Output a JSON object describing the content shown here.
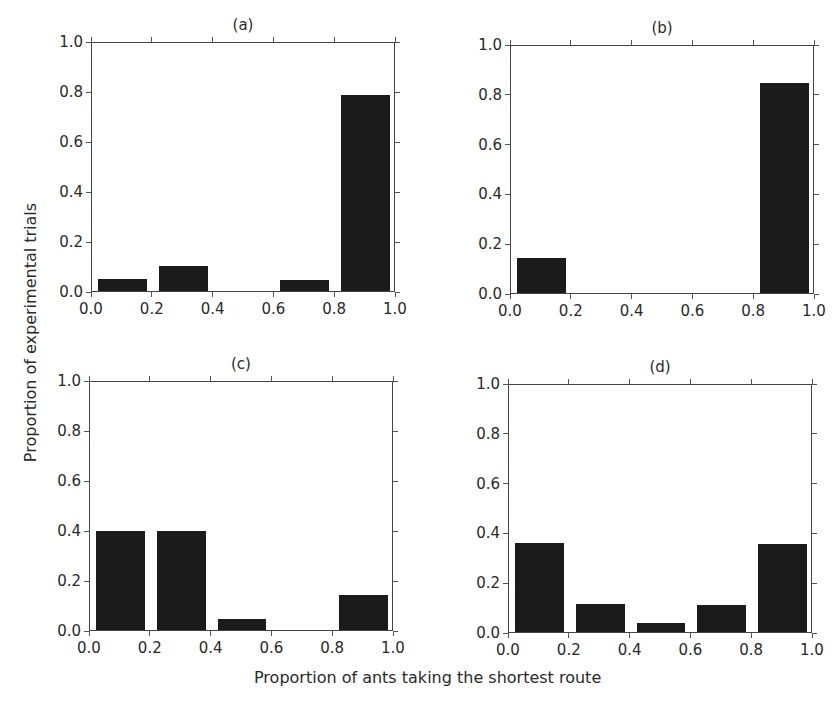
{
  "figure": {
    "ylabel": "Proportion of experimental trials",
    "xlabel": "Proportion of ants taking the shortest route"
  },
  "panels": [
    {
      "title": "(a)",
      "left": 91,
      "top": 42,
      "width": 304,
      "height": 250
    },
    {
      "title": "(b)",
      "left": 510,
      "top": 45,
      "width": 304,
      "height": 249
    },
    {
      "title": "(c)",
      "left": 89,
      "top": 381,
      "width": 304,
      "height": 250
    },
    {
      "title": "(d)",
      "left": 508,
      "top": 384,
      "width": 304,
      "height": 249
    }
  ],
  "ticks": {
    "x": [
      "0.0",
      "0.2",
      "0.4",
      "0.6",
      "0.8",
      "1.0"
    ],
    "y": [
      "0.0",
      "0.2",
      "0.4",
      "0.6",
      "0.8",
      "1.0"
    ]
  },
  "chart_data": [
    {
      "type": "bar",
      "title": "(a)",
      "categories": [
        "0.0-0.2",
        "0.2-0.4",
        "0.4-0.6",
        "0.6-0.8",
        "0.8-1.0"
      ],
      "values": [
        0.05,
        0.1,
        0.0,
        0.045,
        0.79
      ],
      "xlabel": "Proportion of ants taking the shortest route",
      "ylabel": "Proportion of experimental trials",
      "xlim": [
        0,
        1
      ],
      "ylim": [
        0,
        1
      ],
      "grid": false
    },
    {
      "type": "bar",
      "title": "(b)",
      "categories": [
        "0.0-0.2",
        "0.2-0.4",
        "0.4-0.6",
        "0.6-0.8",
        "0.8-1.0"
      ],
      "values": [
        0.14,
        0.0,
        0.0,
        0.0,
        0.85
      ],
      "xlabel": "Proportion of ants taking the shortest route",
      "ylabel": "Proportion of experimental trials",
      "xlim": [
        0,
        1
      ],
      "ylim": [
        0,
        1
      ],
      "grid": false
    },
    {
      "type": "bar",
      "title": "(c)",
      "categories": [
        "0.0-0.2",
        "0.2-0.4",
        "0.4-0.6",
        "0.6-0.8",
        "0.8-1.0"
      ],
      "values": [
        0.4,
        0.4,
        0.045,
        0.0,
        0.14
      ],
      "xlabel": "Proportion of ants taking the shortest route",
      "ylabel": "Proportion of experimental trials",
      "xlim": [
        0,
        1
      ],
      "ylim": [
        0,
        1
      ],
      "grid": false
    },
    {
      "type": "bar",
      "title": "(d)",
      "categories": [
        "0.0-0.2",
        "0.2-0.4",
        "0.4-0.6",
        "0.6-0.8",
        "0.8-1.0"
      ],
      "values": [
        0.36,
        0.115,
        0.035,
        0.11,
        0.355
      ],
      "xlabel": "Proportion of ants taking the shortest route",
      "ylabel": "Proportion of experimental trials",
      "xlim": [
        0,
        1
      ],
      "ylim": [
        0,
        1
      ],
      "grid": false
    }
  ]
}
